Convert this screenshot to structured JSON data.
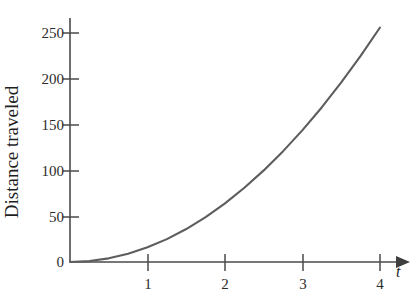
{
  "chart_data": {
    "type": "line",
    "title": "",
    "xlabel": "t",
    "ylabel": "Distance traveled",
    "xlim": [
      0,
      4.25
    ],
    "ylim": [
      0,
      272
    ],
    "grid": false,
    "legend": "none",
    "xticks": [
      "1",
      "2",
      "3",
      "4"
    ],
    "xtick_values": [
      1,
      2,
      3,
      4
    ],
    "yticks": [
      "0",
      "50",
      "100",
      "150",
      "200",
      "250"
    ],
    "ytick_values": [
      0,
      50,
      100,
      150,
      200,
      250
    ],
    "origin_label": "0",
    "series": [
      {
        "name": "Distance traveled",
        "color": "#5d5d5d",
        "relation": "d = 16t^2",
        "x": [
          0,
          0.25,
          0.5,
          0.75,
          1,
          1.25,
          1.5,
          1.75,
          2,
          2.25,
          2.5,
          2.75,
          3,
          3.25,
          3.5,
          3.75,
          4
        ],
        "values": [
          0,
          1,
          4,
          9,
          16,
          25,
          36,
          49,
          64,
          81,
          100,
          121,
          144,
          169,
          196,
          225,
          256
        ]
      }
    ],
    "annotations": []
  },
  "axes": {
    "x_axis_arrow": "arrow-right",
    "y_axis_arrow": "none",
    "axis_color": "#4a4a4a"
  }
}
